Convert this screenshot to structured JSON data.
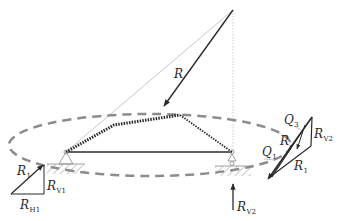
{
  "labels": {
    "resultant": {
      "main": "R",
      "sub": ""
    },
    "left_triangle_r1": {
      "main": "R",
      "sub": "1"
    },
    "left_triangle_rv1": {
      "main": "R",
      "sub": "V1"
    },
    "left_triangle_rh1": {
      "main": "R",
      "sub": "H1"
    },
    "support_rv2": {
      "main": "R",
      "sub": "V2"
    },
    "polygon_q3": {
      "main": "Q",
      "sub": "3"
    },
    "polygon_q1": {
      "main": "Q",
      "sub": "1"
    },
    "polygon_r": {
      "main": "R",
      "sub": ""
    },
    "polygon_rv2": {
      "main": "R",
      "sub": "V2"
    },
    "polygon_r1": {
      "main": "R",
      "sub": "1"
    }
  },
  "colors": {
    "line": "#2b2b2b",
    "dashed_ellipse": "#8c8c8c",
    "construction": "#c4c4c4",
    "hatch": "#9a9a9a"
  }
}
